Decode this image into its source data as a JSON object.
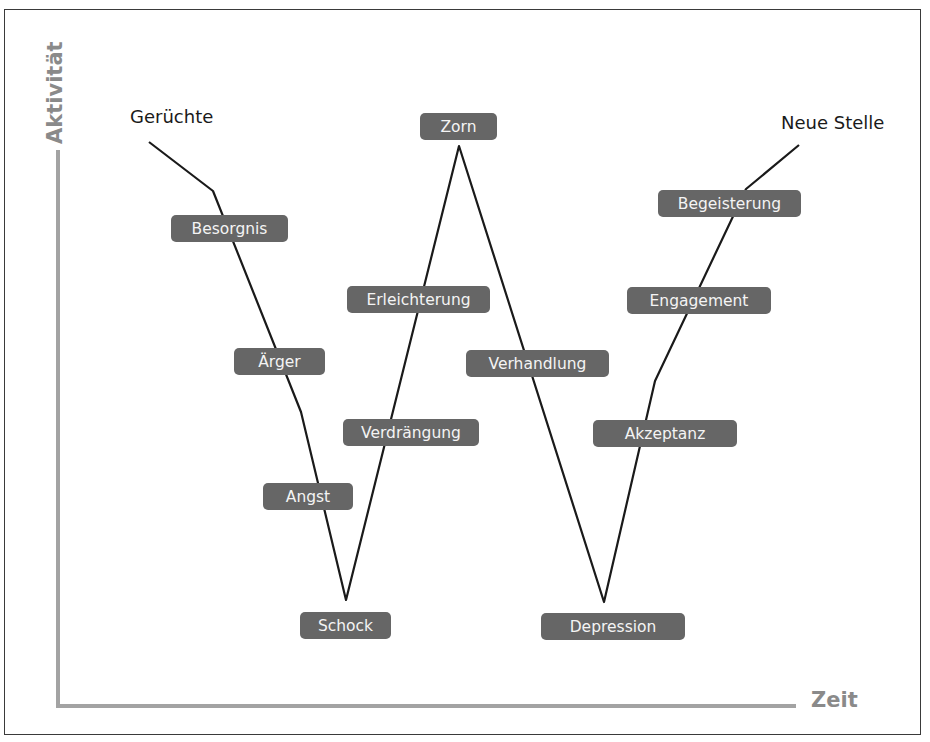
{
  "diagram": {
    "type": "change-curve",
    "axes": {
      "y_label": "Aktivität",
      "x_label": "Zeit"
    },
    "start_label": "Gerüchte",
    "end_label": "Neue Stelle",
    "phases": [
      {
        "id": "besorgnis",
        "label": "Besorgnis"
      },
      {
        "id": "aerger",
        "label": "Ärger"
      },
      {
        "id": "angst",
        "label": "Angst"
      },
      {
        "id": "schock",
        "label": "Schock"
      },
      {
        "id": "verdraengung",
        "label": "Verdrängung"
      },
      {
        "id": "erleichterung",
        "label": "Erleichterung"
      },
      {
        "id": "zorn",
        "label": "Zorn"
      },
      {
        "id": "verhandlung",
        "label": "Verhandlung"
      },
      {
        "id": "depression",
        "label": "Depression"
      },
      {
        "id": "akzeptanz",
        "label": "Akzeptanz"
      },
      {
        "id": "engagement",
        "label": "Engagement"
      },
      {
        "id": "begeisterung",
        "label": "Begeisterung"
      }
    ],
    "colors": {
      "pill_bg": "#666666",
      "pill_text": "#f4f4f4",
      "axis": "#a3a3a3",
      "axis_label": "#8a8a8a",
      "curve": "#1a1a1a"
    }
  }
}
